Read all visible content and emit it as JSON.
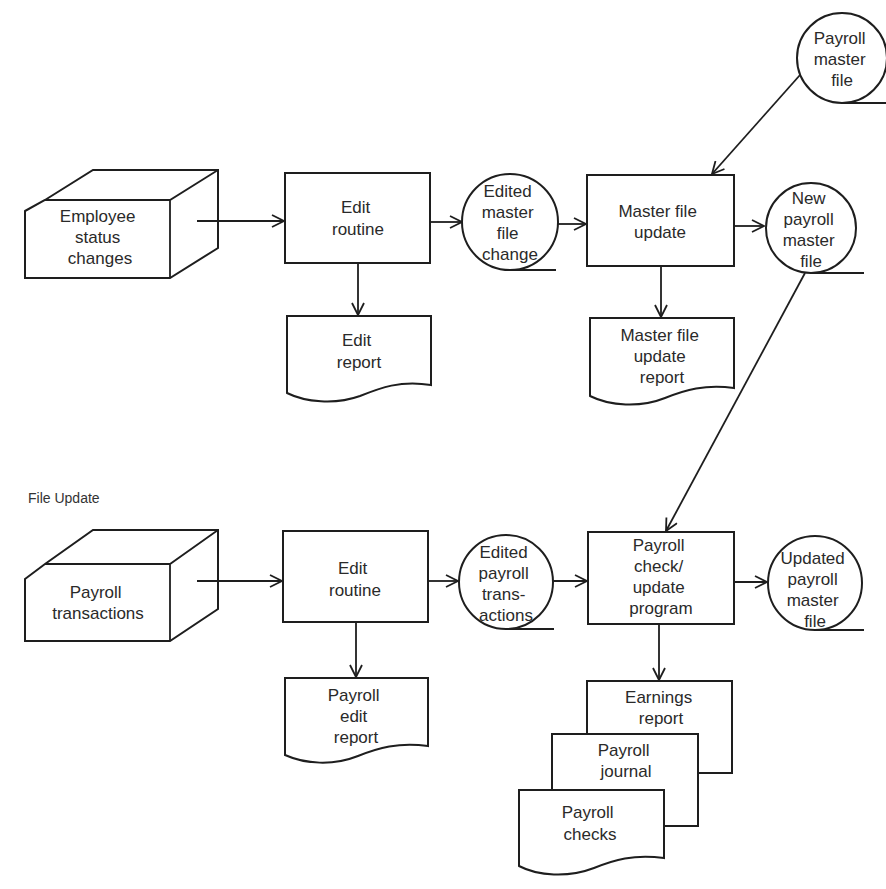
{
  "diagram": {
    "section_label": "File Update",
    "top_flow": {
      "input": {
        "type": "keyboard-input",
        "lines": [
          "Employee",
          "status",
          "changes"
        ]
      },
      "edit_process": {
        "type": "process",
        "lines": [
          "Edit",
          "routine"
        ]
      },
      "edit_report": {
        "type": "document",
        "lines": [
          "Edit",
          "report"
        ]
      },
      "edited_file": {
        "type": "tape-file",
        "lines": [
          "Edited",
          "master",
          "file",
          "change"
        ]
      },
      "update_process": {
        "type": "process",
        "lines": [
          "Master file",
          "update"
        ]
      },
      "update_report": {
        "type": "document",
        "lines": [
          "Master file",
          "update",
          "report"
        ]
      },
      "master_file": {
        "type": "tape-file",
        "lines": [
          "Payroll",
          "master",
          "file"
        ]
      },
      "new_master_file": {
        "type": "tape-file",
        "lines": [
          "New",
          "payroll",
          "master",
          "file"
        ]
      }
    },
    "bottom_flow": {
      "input": {
        "type": "keyboard-input",
        "lines": [
          "Payroll",
          "transactions"
        ]
      },
      "edit_process": {
        "type": "process",
        "lines": [
          "Edit",
          "routine"
        ]
      },
      "edit_report": {
        "type": "document",
        "lines": [
          "Payroll",
          "edit",
          "report"
        ]
      },
      "edited_file": {
        "type": "tape-file",
        "lines": [
          "Edited",
          "payroll",
          "trans-",
          "actions"
        ]
      },
      "check_process": {
        "type": "process",
        "lines": [
          "Payroll",
          "check/",
          "update",
          "program"
        ]
      },
      "updated_master_file": {
        "type": "tape-file",
        "lines": [
          "Updated",
          "payroll",
          "master",
          "file"
        ]
      },
      "outputs": [
        {
          "type": "document",
          "lines": [
            "Earnings",
            "report"
          ]
        },
        {
          "type": "document",
          "lines": [
            "Payroll",
            "journal"
          ]
        },
        {
          "type": "document",
          "lines": [
            "Payroll",
            "checks"
          ]
        }
      ]
    },
    "colors": {
      "stroke": "#1e1e1e",
      "text": "#2a2a2a",
      "background": "#ffffff"
    }
  }
}
